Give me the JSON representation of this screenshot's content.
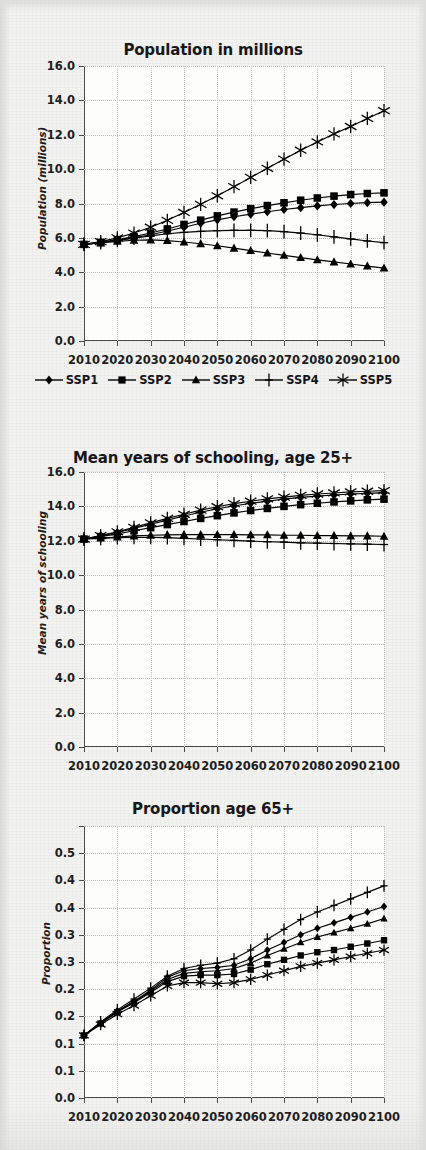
{
  "figure": {
    "background_color": "#f1f1ef",
    "plot_background_color": "#fdfdfc",
    "line_color": "#000000"
  },
  "legend": {
    "position": "below-first-panel",
    "items": [
      {
        "label": "SSP1",
        "marker": "diamond"
      },
      {
        "label": "SSP2",
        "marker": "square"
      },
      {
        "label": "SSP3",
        "marker": "triangle"
      },
      {
        "label": "SSP4",
        "marker": "plus"
      },
      {
        "label": "SSP5",
        "marker": "asterisk"
      }
    ]
  },
  "chart_data": [
    {
      "type": "line",
      "title": "Population in millions",
      "xlabel": "",
      "ylabel": "Population (millions)",
      "x": [
        2010,
        2015,
        2020,
        2025,
        2030,
        2035,
        2040,
        2045,
        2050,
        2055,
        2060,
        2065,
        2070,
        2075,
        2080,
        2085,
        2090,
        2095,
        2100
      ],
      "xlim": [
        2010,
        2100
      ],
      "ylim": [
        0.0,
        16.0
      ],
      "ytick_labels": [
        "0.0",
        "2.0",
        "4.0",
        "6.0",
        "8.0",
        "10.0",
        "12.0",
        "14.0",
        "16.0"
      ],
      "ytick_values": [
        0.0,
        2.0,
        4.0,
        6.0,
        8.0,
        10.0,
        12.0,
        14.0,
        16.0
      ],
      "xtick_labels": [
        "2010",
        "2020",
        "2030",
        "2040",
        "2050",
        "2060",
        "2070",
        "2080",
        "2090",
        "2100"
      ],
      "xtick_values": [
        2010,
        2020,
        2030,
        2040,
        2050,
        2060,
        2070,
        2080,
        2090,
        2100
      ],
      "grid": true,
      "series": [
        {
          "name": "SSP1",
          "marker": "diamond",
          "values": [
            5.62,
            5.72,
            5.86,
            6.0,
            6.18,
            6.4,
            6.62,
            6.85,
            7.05,
            7.23,
            7.38,
            7.52,
            7.65,
            7.76,
            7.86,
            7.94,
            8.0,
            8.05,
            8.08
          ]
        },
        {
          "name": "SSP2",
          "marker": "square",
          "values": [
            5.62,
            5.74,
            5.9,
            6.07,
            6.28,
            6.52,
            6.78,
            7.03,
            7.28,
            7.5,
            7.7,
            7.88,
            8.04,
            8.19,
            8.32,
            8.43,
            8.52,
            8.58,
            8.62
          ]
        },
        {
          "name": "SSP3",
          "marker": "triangle",
          "values": [
            5.62,
            5.7,
            5.8,
            5.86,
            5.88,
            5.84,
            5.76,
            5.66,
            5.54,
            5.4,
            5.26,
            5.12,
            4.98,
            4.85,
            4.72,
            4.6,
            4.48,
            4.36,
            4.24
          ]
        },
        {
          "name": "SSP4",
          "marker": "plus",
          "values": [
            5.62,
            5.72,
            5.85,
            5.98,
            6.12,
            6.24,
            6.32,
            6.38,
            6.42,
            6.44,
            6.44,
            6.42,
            6.36,
            6.28,
            6.18,
            6.06,
            5.94,
            5.82,
            5.72
          ]
        },
        {
          "name": "SSP5",
          "marker": "asterisk",
          "values": [
            5.62,
            5.78,
            6.0,
            6.28,
            6.62,
            7.02,
            7.48,
            7.95,
            8.45,
            8.98,
            9.52,
            10.05,
            10.58,
            11.1,
            11.58,
            12.05,
            12.48,
            12.95,
            13.4
          ]
        }
      ]
    },
    {
      "type": "line",
      "title": "Mean years of schooling, age 25+",
      "xlabel": "",
      "ylabel": "Mean years of schooling",
      "x": [
        2010,
        2015,
        2020,
        2025,
        2030,
        2035,
        2040,
        2045,
        2050,
        2055,
        2060,
        2065,
        2070,
        2075,
        2080,
        2085,
        2090,
        2095,
        2100
      ],
      "xlim": [
        2010,
        2100
      ],
      "ylim": [
        0.0,
        16.0
      ],
      "ytick_labels": [
        "0.0",
        "2.0",
        "4.0",
        "6.0",
        "8.0",
        "10.0",
        "12.0",
        "14.0",
        "16.0"
      ],
      "ytick_values": [
        0.0,
        2.0,
        4.0,
        6.0,
        8.0,
        10.0,
        12.0,
        14.0,
        16.0
      ],
      "xtick_labels": [
        "2010",
        "2020",
        "2030",
        "2040",
        "2050",
        "2060",
        "2070",
        "2080",
        "2090",
        "2100"
      ],
      "xtick_values": [
        2010,
        2020,
        2030,
        2040,
        2050,
        2060,
        2070,
        2080,
        2090,
        2100
      ],
      "grid": true,
      "series": [
        {
          "name": "SSP1",
          "marker": "diamond",
          "values": [
            12.1,
            12.28,
            12.48,
            12.72,
            12.96,
            13.2,
            13.44,
            13.66,
            13.86,
            14.02,
            14.18,
            14.3,
            14.42,
            14.52,
            14.6,
            14.66,
            14.72,
            14.76,
            14.8
          ]
        },
        {
          "name": "SSP2",
          "marker": "square",
          "values": [
            12.1,
            12.24,
            12.4,
            12.58,
            12.76,
            12.94,
            13.12,
            13.3,
            13.46,
            13.62,
            13.76,
            13.88,
            14.0,
            14.1,
            14.18,
            14.26,
            14.32,
            14.38,
            14.42
          ]
        },
        {
          "name": "SSP3",
          "marker": "triangle",
          "values": [
            12.1,
            12.16,
            12.22,
            12.28,
            12.32,
            12.34,
            12.36,
            12.36,
            12.36,
            12.36,
            12.34,
            12.34,
            12.32,
            12.32,
            12.3,
            12.3,
            12.28,
            12.28,
            12.26
          ]
        },
        {
          "name": "SSP4",
          "marker": "plus",
          "values": [
            12.1,
            12.14,
            12.18,
            12.2,
            12.2,
            12.18,
            12.14,
            12.1,
            12.06,
            12.02,
            11.98,
            11.94,
            11.92,
            11.88,
            11.86,
            11.84,
            11.82,
            11.8,
            11.78
          ]
        },
        {
          "name": "SSP5",
          "marker": "asterisk",
          "values": [
            12.1,
            12.3,
            12.52,
            12.78,
            13.04,
            13.3,
            13.54,
            13.78,
            13.98,
            14.16,
            14.3,
            14.44,
            14.54,
            14.64,
            14.72,
            14.78,
            14.84,
            14.88,
            14.92
          ]
        }
      ]
    },
    {
      "type": "line",
      "title": "Proportion age 65+",
      "xlabel": "",
      "ylabel": "Proportion",
      "x": [
        2010,
        2015,
        2020,
        2025,
        2030,
        2035,
        2040,
        2045,
        2050,
        2055,
        2060,
        2065,
        2070,
        2075,
        2080,
        2085,
        2090,
        2095,
        2100
      ],
      "xlim": [
        2010,
        2100
      ],
      "ylim": [
        0.0,
        0.5
      ],
      "ytick_labels": [
        "0.0",
        "0.1",
        "0.1",
        "0.2",
        "0.2",
        "0.3",
        "0.3",
        "0.4",
        "0.4",
        "0.5"
      ],
      "ytick_values": [
        0.0,
        0.05,
        0.1,
        0.15,
        0.2,
        0.25,
        0.3,
        0.35,
        0.4,
        0.45,
        0.5
      ],
      "xtick_labels": [
        "2010",
        "2020",
        "2030",
        "2040",
        "2050",
        "2060",
        "2070",
        "2080",
        "2090",
        "2100"
      ],
      "xtick_values": [
        2010,
        2020,
        2030,
        2040,
        2050,
        2060,
        2070,
        2080,
        2090,
        2100
      ],
      "grid": true,
      "series": [
        {
          "name": "SSP1",
          "marker": "diamond",
          "values": [
            0.115,
            0.138,
            0.16,
            0.178,
            0.198,
            0.222,
            0.234,
            0.238,
            0.24,
            0.244,
            0.256,
            0.272,
            0.286,
            0.3,
            0.312,
            0.322,
            0.332,
            0.342,
            0.352
          ]
        },
        {
          "name": "SSP2",
          "marker": "square",
          "values": [
            0.115,
            0.137,
            0.158,
            0.175,
            0.194,
            0.214,
            0.224,
            0.226,
            0.226,
            0.228,
            0.236,
            0.246,
            0.254,
            0.262,
            0.268,
            0.272,
            0.278,
            0.284,
            0.29
          ]
        },
        {
          "name": "SSP3",
          "marker": "triangle",
          "values": [
            0.115,
            0.138,
            0.159,
            0.177,
            0.196,
            0.218,
            0.229,
            0.232,
            0.234,
            0.238,
            0.248,
            0.262,
            0.274,
            0.286,
            0.296,
            0.304,
            0.312,
            0.32,
            0.33
          ]
        },
        {
          "name": "SSP4",
          "marker": "plus",
          "values": [
            0.115,
            0.14,
            0.162,
            0.182,
            0.202,
            0.224,
            0.238,
            0.244,
            0.248,
            0.256,
            0.272,
            0.292,
            0.31,
            0.328,
            0.342,
            0.354,
            0.366,
            0.378,
            0.39
          ]
        },
        {
          "name": "SSP5",
          "marker": "asterisk",
          "values": [
            0.115,
            0.135,
            0.154,
            0.17,
            0.188,
            0.206,
            0.212,
            0.212,
            0.21,
            0.212,
            0.218,
            0.226,
            0.234,
            0.242,
            0.248,
            0.254,
            0.26,
            0.266,
            0.272
          ]
        }
      ]
    }
  ]
}
